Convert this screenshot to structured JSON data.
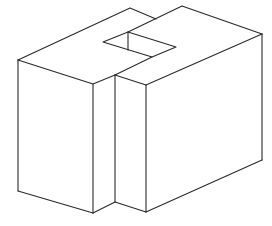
{
  "figure": {
    "stroke_color": "#2a2a2a",
    "background": "#ffffff"
  },
  "geometry": {
    "left_block_top": [
      [
        18,
        60
      ],
      [
        130,
        8
      ],
      [
        150,
        17
      ],
      [
        115,
        33
      ],
      [
        103,
        42
      ],
      [
        152,
        57
      ],
      [
        115,
        75
      ],
      [
        93,
        84
      ]
    ],
    "right_block_top": [
      [
        128,
        32
      ],
      [
        182,
        6
      ],
      [
        262,
        34
      ],
      [
        146,
        85
      ],
      [
        115,
        75
      ]
    ],
    "hole": [
      [
        103,
        42
      ],
      [
        128,
        32
      ],
      [
        176,
        47
      ],
      [
        152,
        57
      ]
    ],
    "hole_inner_edge": [
      [
        128,
        32
      ],
      [
        128,
        50
      ]
    ],
    "vertical_edges": [
      [
        [
          18,
          60
        ],
        [
          18,
          191
        ]
      ],
      [
        [
          93,
          84
        ],
        [
          93,
          213
        ]
      ],
      [
        [
          115,
          75
        ],
        [
          115,
          202
        ]
      ],
      [
        [
          146,
          85
        ],
        [
          146,
          212
        ]
      ],
      [
        [
          262,
          34
        ],
        [
          262,
          160
        ]
      ]
    ],
    "bottom_edges": [
      [
        [
          18,
          191
        ],
        [
          93,
          213
        ]
      ],
      [
        [
          93,
          213
        ],
        [
          115,
          202
        ]
      ],
      [
        [
          115,
          202
        ],
        [
          146,
          212
        ]
      ],
      [
        [
          146,
          212
        ],
        [
          262,
          160
        ]
      ]
    ]
  }
}
